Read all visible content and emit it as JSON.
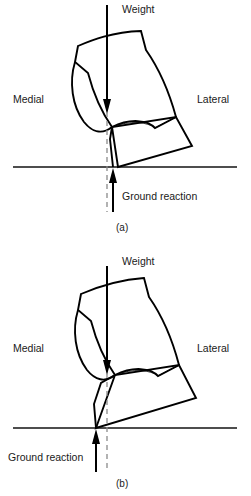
{
  "figure": {
    "title_absent": true,
    "type": "biomechanics-line-diagram",
    "panels": [
      {
        "id": "a",
        "caption": "(a)",
        "labels": {
          "weight": "Weight",
          "medial": "Medial",
          "lateral": "Lateral",
          "ground_reaction": "Ground reaction"
        },
        "geometry": {
          "ground_line_y": 167,
          "ground_line_x_start": 13,
          "ground_line_x_end": 237,
          "plumb_x": 107,
          "plumb_top": 112,
          "plumb_bottom": 212,
          "weight_arrow_x": 107,
          "weight_arrow_top": 5,
          "weight_arrow_tip": 112,
          "ground_reaction_x": 113,
          "ground_reaction_bottom": 212,
          "ground_reaction_tip": 168,
          "contact_point_x": 113,
          "contact_point_y": 167
        }
      },
      {
        "id": "b",
        "caption": "(b)",
        "labels": {
          "weight": "Weight",
          "medial": "Medial",
          "lateral": "Lateral",
          "ground_reaction": "Ground reaction"
        },
        "geometry": {
          "ground_line_y": 428,
          "ground_line_x_start": 13,
          "ground_line_x_end": 237,
          "plumb_x": 107,
          "plumb_top": 373,
          "plumb_bottom": 472,
          "weight_arrow_x": 107,
          "weight_arrow_top": 266,
          "weight_arrow_tip": 373,
          "ground_reaction_x": 96,
          "ground_reaction_bottom": 472,
          "ground_reaction_tip": 429,
          "contact_point_x": 96,
          "contact_point_y": 428
        }
      }
    ],
    "colors": {
      "outline": "#000000",
      "ground": "#4d4d4d",
      "plumb": "#8a8a8a",
      "text": "#1a1a1a",
      "background": "#ffffff"
    }
  }
}
